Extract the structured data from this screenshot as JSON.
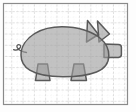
{
  "figure": {
    "title": "Pig silhouette on grid paper",
    "subject": "pig",
    "orientation": "facing-right",
    "medium": "graph-paper",
    "canvas": {
      "width": 136,
      "height": 112,
      "background": "#fdfdfd"
    },
    "frame": {
      "name": "grid-border",
      "x": 3.5,
      "y": 3.5,
      "width": 124,
      "height": 101,
      "stroke": "#8a8a8a",
      "stroke_width": 1.2,
      "fill": "#ffffff"
    },
    "grid": {
      "major": {
        "label": "major-grid-lines",
        "cell_width": 11.3,
        "cell_height": 11.2,
        "columns": 11,
        "rows": 9,
        "color": "#b9b9b9",
        "stroke_width": 0.8,
        "style": "dashed",
        "dash": "2.2 1.6"
      },
      "minor": {
        "label": "minor-grid-lines",
        "cell_width": 5.65,
        "cell_height": 5.6,
        "color": "#dcdcdc",
        "stroke_width": 0.5,
        "style": "dotted",
        "dash": "0.8 1.8"
      }
    },
    "shape": {
      "name": "pig-silhouette",
      "fill": "#9c9c9c",
      "fill_opacity": 0.62,
      "stroke": "#5a5a5a",
      "stroke_width": 1.5,
      "parts": [
        {
          "name": "body",
          "description": "large rounded oval torso"
        },
        {
          "name": "head",
          "description": "head merged with body on the right"
        },
        {
          "name": "snout",
          "description": "blunt rectangular snout at far right"
        },
        {
          "name": "ear-front",
          "description": "pointed triangular ear"
        },
        {
          "name": "ear-back",
          "description": "second pointed triangular ear"
        },
        {
          "name": "front-leg",
          "description": "trapezoidal leg with hoof"
        },
        {
          "name": "hind-leg",
          "description": "trapezoidal leg with hoof"
        },
        {
          "name": "tail",
          "description": "curly spiral tail at left"
        }
      ]
    }
  },
  "labels": {
    "figure_caption": "",
    "annotations": []
  }
}
